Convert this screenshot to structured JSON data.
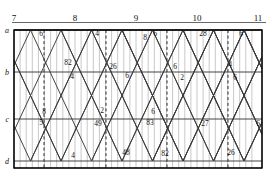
{
  "chart_data": {
    "type": "line",
    "title": "",
    "xlabel": "",
    "ylabel": "",
    "grid": true,
    "legend": "none",
    "x_axis": {
      "position": "top",
      "tick_labels": [
        "7",
        "8",
        "9",
        "10",
        "11"
      ],
      "tick_x": [
        14,
        75,
        136,
        197,
        258
      ],
      "range": [
        7,
        11
      ],
      "minor_ticks_per_major": 10
    },
    "y_axis": {
      "position": "left",
      "tick_labels": [
        "a",
        "b",
        "c",
        "d"
      ],
      "tick_y": [
        30,
        72,
        119,
        161
      ]
    },
    "point_labels": [
      {
        "text": "6",
        "x": 41,
        "y": 36,
        "row": "a"
      },
      {
        "text": "4",
        "x": 97,
        "y": 36,
        "row": "a"
      },
      {
        "text": "8",
        "x": 145,
        "y": 40,
        "row": "a"
      },
      {
        "text": "6",
        "x": 155,
        "y": 36,
        "row": "a"
      },
      {
        "text": "28",
        "x": 203,
        "y": 36,
        "row": "a"
      },
      {
        "text": "6",
        "x": 241,
        "y": 36,
        "row": "a"
      },
      {
        "text": "82",
        "x": 68,
        "y": 65,
        "row": "b"
      },
      {
        "text": "4",
        "x": 72,
        "y": 79,
        "row": "b"
      },
      {
        "text": "26",
        "x": 113,
        "y": 69,
        "row": "b"
      },
      {
        "text": "6",
        "x": 127,
        "y": 78,
        "row": "b"
      },
      {
        "text": "6",
        "x": 175,
        "y": 69,
        "row": "b"
      },
      {
        "text": "2",
        "x": 182,
        "y": 80,
        "row": "b"
      },
      {
        "text": "4",
        "x": 230,
        "y": 67,
        "row": "b"
      },
      {
        "text": "6",
        "x": 235,
        "y": 80,
        "row": "b"
      },
      {
        "text": "8",
        "x": 44,
        "y": 114,
        "row": "c"
      },
      {
        "text": "5",
        "x": 41,
        "y": 125,
        "row": "c"
      },
      {
        "text": "2",
        "x": 102,
        "y": 113,
        "row": "c"
      },
      {
        "text": "49",
        "x": 98,
        "y": 126,
        "row": "c"
      },
      {
        "text": "6",
        "x": 153,
        "y": 114,
        "row": "c"
      },
      {
        "text": "83",
        "x": 150,
        "y": 125,
        "row": "c"
      },
      {
        "text": "27",
        "x": 205,
        "y": 126,
        "row": "c"
      },
      {
        "text": "6",
        "x": 258,
        "y": 126,
        "row": "c"
      },
      {
        "text": "4",
        "x": 73,
        "y": 158,
        "row": "d"
      },
      {
        "text": "48",
        "x": 126,
        "y": 155,
        "row": "d"
      },
      {
        "text": "82",
        "x": 165,
        "y": 156,
        "row": "d"
      },
      {
        "text": "26",
        "x": 231,
        "y": 155,
        "row": "d"
      }
    ],
    "hour_markers_dashed_x": [
      44,
      106,
      167,
      228
    ],
    "series": [
      {
        "name": "up-1",
        "points": [
          [
            14,
            72
          ],
          [
            41,
            30
          ],
          [
            72,
            72
          ],
          [
            104,
            119
          ],
          [
            74,
            161
          ],
          [
            44,
            119
          ],
          [
            14,
            72
          ]
        ]
      },
      {
        "name": "down-1",
        "points": [
          [
            14,
            30
          ],
          [
            44,
            72
          ],
          [
            75,
            119
          ],
          [
            105,
            161
          ]
        ]
      }
    ]
  },
  "figure": {
    "frame_color": "#000000",
    "grid_color": "#9a9a9a",
    "line_color": "#3a3a3a",
    "dash_color": "#222222"
  }
}
